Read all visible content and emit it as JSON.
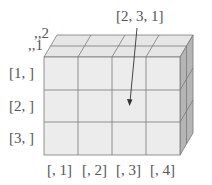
{
  "diagram": {
    "callout": "[2, 3, 1]",
    "layer_labels": [
      ",,1",
      ",,2"
    ],
    "row_labels": [
      "[1, ]",
      "[2, ]",
      "[3, ]"
    ],
    "col_labels": [
      "[, 1]",
      "[, 2]",
      "[, 3]",
      "[, 4]"
    ],
    "colors": {
      "front": "#ececec",
      "top": "#e6e6e6",
      "side": "#b5b5b5",
      "line": "#7a7a7a",
      "text": "#555555"
    }
  }
}
